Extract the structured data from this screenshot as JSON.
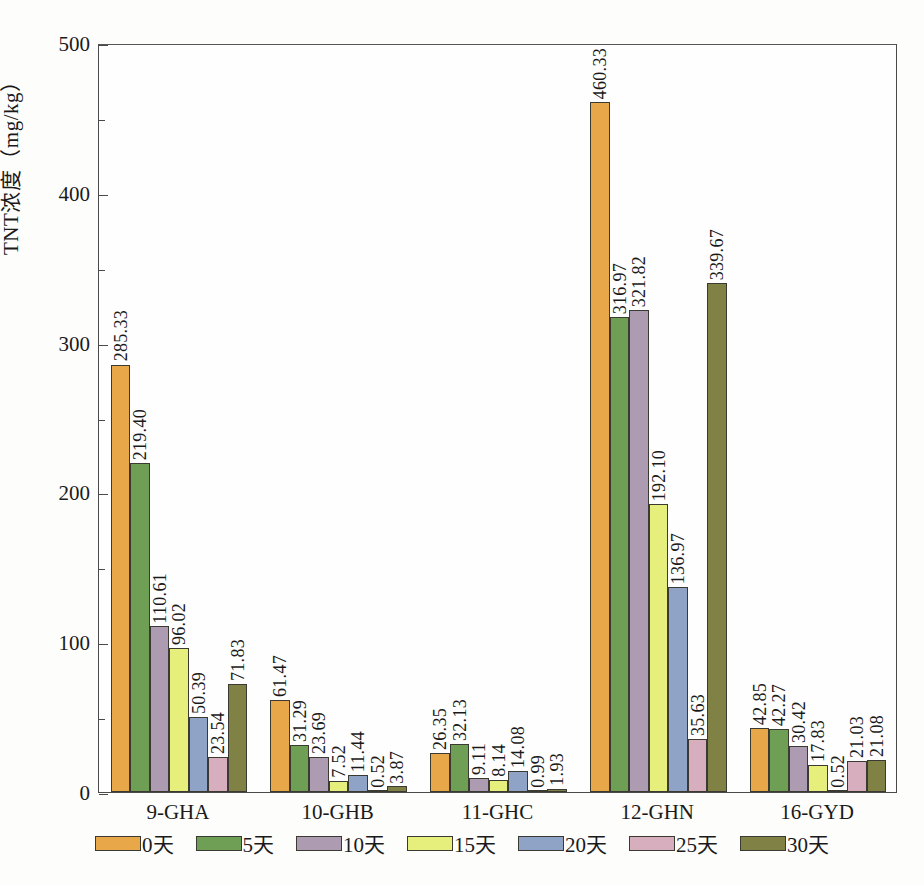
{
  "chart_data": {
    "type": "bar",
    "title": "",
    "xlabel": "",
    "ylabel": "TNT浓度（mg/kg）",
    "ylim": [
      0,
      500
    ],
    "ytick_labels": [
      "0",
      "100",
      "200",
      "300",
      "400",
      "500"
    ],
    "ytick_values": [
      0,
      100,
      200,
      300,
      400,
      500
    ],
    "yminor_values": [
      50,
      150,
      250,
      350,
      450
    ],
    "grid": false,
    "legend_position": "bottom",
    "categories": [
      "9-GHA",
      "10-GHB",
      "11-GHC",
      "12-GHN",
      "16-GYD"
    ],
    "series": [
      {
        "name": "0天",
        "color": "#e8a84a",
        "values": [
          285.33,
          61.47,
          26.35,
          460.33,
          42.85
        ]
      },
      {
        "name": "5天",
        "color": "#6f9f55",
        "values": [
          219.4,
          31.29,
          32.13,
          316.97,
          42.27
        ]
      },
      {
        "name": "10天",
        "color": "#ac9bb1",
        "values": [
          110.61,
          23.69,
          9.11,
          321.82,
          30.42
        ]
      },
      {
        "name": "15天",
        "color": "#e6ee7c",
        "values": [
          96.02,
          7.52,
          8.14,
          192.1,
          17.83
        ]
      },
      {
        "name": "20天",
        "color": "#8fa3c6",
        "values": [
          50.39,
          11.44,
          14.08,
          136.97,
          0.52
        ]
      },
      {
        "name": "25天",
        "color": "#d6aebe",
        "values": [
          23.54,
          0.52,
          0.99,
          35.63,
          21.03
        ]
      },
      {
        "name": "30天",
        "color": "#7f8244",
        "values": [
          71.83,
          3.87,
          1.93,
          339.67,
          21.08
        ]
      }
    ],
    "value_labels": [
      [
        "285.33",
        "219.40",
        "110.61",
        "96.02",
        "50.39",
        "23.54",
        "71.83"
      ],
      [
        "61.47",
        "31.29",
        "23.69",
        "7.52",
        "11.44",
        "0.52",
        "3.87"
      ],
      [
        "26.35",
        "32.13",
        "9.11",
        "8.14",
        "14.08",
        "0.99",
        "1.93"
      ],
      [
        "460.33",
        "316.97",
        "321.82",
        "192.10",
        "136.97",
        "35.63",
        "339.67"
      ],
      [
        "42.85",
        "42.27",
        "30.42",
        "17.83",
        "0.52",
        "21.03",
        "21.08"
      ]
    ]
  },
  "caption": ""
}
